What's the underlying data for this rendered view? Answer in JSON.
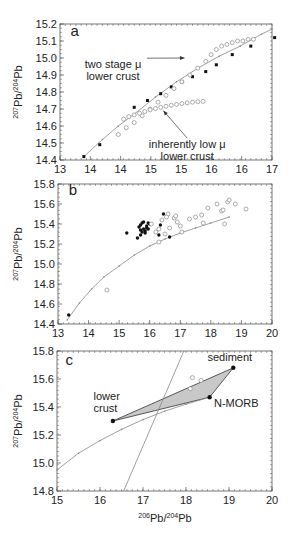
{
  "chart_data": [
    {
      "panel": "a",
      "type": "line",
      "title": "",
      "xlabel": "",
      "ylabel": "207Pb/204Pb",
      "xlim": [
        13,
        17
      ],
      "ylim": [
        14.4,
        15.2
      ],
      "xticks": [
        13,
        13.5,
        14,
        14.5,
        15,
        15.5,
        16,
        16.5,
        17
      ],
      "xtick_labels": [
        "13",
        "14",
        "14",
        "15",
        "15",
        "16",
        "16",
        "17"
      ],
      "yticks": [
        14.4,
        14.5,
        14.6,
        14.7,
        14.8,
        14.9,
        15.0,
        15.1,
        15.2
      ],
      "ytick_labels": [
        "14.4",
        "14.5",
        "14.6",
        "14.7",
        "14.8",
        "14.9",
        "15.0",
        "15.1",
        "15.2"
      ],
      "grid": false,
      "series": [
        {
          "name": "Pb growth curve (solid markers)",
          "marker": "filled-square",
          "x": [
            13.45,
            13.75,
            14.4,
            14.65,
            14.9,
            15.1,
            15.3,
            15.5,
            15.75,
            15.95,
            16.25,
            16.6,
            17.05
          ],
          "y": [
            14.42,
            14.49,
            14.71,
            14.75,
            14.79,
            14.83,
            14.86,
            14.89,
            14.92,
            14.96,
            15.02,
            15.07,
            15.12
          ]
        },
        {
          "name": "two stage μ lower crust",
          "marker": "open-circle",
          "x": [
            14.1,
            14.25,
            14.4,
            14.55,
            14.7,
            14.85,
            15.0,
            15.15,
            15.3,
            15.45,
            15.6,
            15.75,
            15.85,
            15.95,
            16.05,
            16.15,
            16.25,
            16.35,
            16.45,
            16.55,
            16.65
          ],
          "y": [
            14.55,
            14.59,
            14.62,
            14.66,
            14.7,
            14.74,
            14.78,
            14.82,
            14.86,
            14.9,
            14.94,
            14.98,
            15.02,
            15.05,
            15.07,
            15.08,
            15.09,
            15.1,
            15.1,
            15.11,
            15.11
          ]
        },
        {
          "name": "inherently low μ lower crust",
          "marker": "open-circle",
          "x": [
            14.2,
            14.3,
            14.4,
            14.5,
            14.6,
            14.7,
            14.8,
            14.9,
            15.0,
            15.1,
            15.2,
            15.3,
            15.4,
            15.5,
            15.6,
            15.7
          ],
          "y": [
            14.64,
            14.655,
            14.665,
            14.675,
            14.685,
            14.695,
            14.703,
            14.71,
            14.716,
            14.722,
            14.727,
            14.732,
            14.736,
            14.74,
            14.743,
            14.745
          ]
        },
        {
          "name": "model curve",
          "marker": "line",
          "x": [
            13.45,
            13.8,
            14.1,
            14.4,
            14.8,
            15.2,
            15.6,
            16.0,
            16.4,
            16.8,
            17.0
          ],
          "y": [
            14.42,
            14.52,
            14.6,
            14.67,
            14.77,
            14.86,
            14.94,
            15.01,
            15.07,
            15.14,
            15.17
          ]
        }
      ],
      "annotations": [
        {
          "label": "a",
          "x": 13.2,
          "y": 15.13
        },
        {
          "text_lines": [
            "two stage μ",
            "lower crust"
          ],
          "x": 14.0,
          "y": 14.94,
          "arrow_to": [
            15.35,
            15.0
          ]
        },
        {
          "text_lines": [
            "inherently low μ",
            "lower crust"
          ],
          "x": 15.4,
          "y": 14.47,
          "arrow_to": [
            14.95,
            14.69
          ]
        }
      ]
    },
    {
      "panel": "b",
      "type": "scatter",
      "xlabel": "",
      "ylabel": "207Pb/204Pb",
      "xlim": [
        13,
        20
      ],
      "ylim": [
        14.4,
        15.8
      ],
      "xticks": [
        13,
        14,
        15,
        16,
        17,
        18,
        19,
        20
      ],
      "xtick_labels": [
        "13",
        "14",
        "15",
        "16",
        "17",
        "18",
        "19",
        "20"
      ],
      "yticks": [
        14.4,
        14.6,
        14.8,
        15.0,
        15.2,
        15.4,
        15.6,
        15.8
      ],
      "ytick_labels": [
        "14.4",
        "14.6",
        "14.8",
        "15.0",
        "15.2",
        "15.4",
        "15.6",
        "15.8"
      ],
      "grid": false,
      "series": [
        {
          "name": "filled samples",
          "marker": "filled-circle",
          "x": [
            13.35,
            15.25,
            15.6,
            15.7,
            15.65,
            15.75,
            15.8,
            15.85,
            15.7,
            15.9,
            15.95,
            16.0,
            15.8,
            15.75,
            15.85,
            15.9,
            16.3,
            16.35,
            16.45,
            16.65,
            15.7,
            15.95
          ],
          "y": [
            14.49,
            15.31,
            15.26,
            15.29,
            15.37,
            15.41,
            15.35,
            15.33,
            15.39,
            15.36,
            15.35,
            15.4,
            15.42,
            15.32,
            15.31,
            15.38,
            15.29,
            15.39,
            15.5,
            15.27,
            15.34,
            15.41
          ]
        },
        {
          "name": "open samples",
          "marker": "open-circle",
          "x": [
            14.6,
            16.05,
            16.2,
            16.3,
            16.4,
            16.5,
            16.6,
            16.65,
            16.8,
            16.85,
            17.0,
            17.05,
            17.3,
            17.5,
            17.7,
            17.75,
            17.9,
            18.2,
            18.35,
            18.4,
            18.45,
            18.55,
            18.6,
            18.8,
            19.15,
            16.3,
            16.55,
            16.9
          ],
          "y": [
            14.74,
            15.4,
            15.32,
            15.22,
            15.44,
            15.3,
            15.5,
            15.36,
            15.46,
            15.48,
            15.38,
            15.32,
            15.45,
            15.47,
            15.49,
            15.41,
            15.56,
            15.6,
            15.53,
            15.54,
            15.4,
            15.62,
            15.64,
            15.6,
            15.55,
            15.35,
            15.47,
            15.42
          ]
        },
        {
          "name": "model curve",
          "marker": "line",
          "x": [
            13.3,
            13.7,
            14.1,
            14.5,
            15.0,
            15.5,
            16.0,
            16.5,
            17.0,
            17.5,
            18.0,
            18.6
          ],
          "y": [
            14.44,
            14.61,
            14.75,
            14.87,
            14.98,
            15.09,
            15.18,
            15.25,
            15.31,
            15.36,
            15.41,
            15.47
          ]
        }
      ],
      "annotations": [
        {
          "label": "b",
          "x": 13.35,
          "y": 15.69
        }
      ]
    },
    {
      "panel": "c",
      "type": "scatter",
      "xlabel": "206Pb/204Pb",
      "ylabel": "207Pb/204Pb",
      "xlim": [
        15,
        20
      ],
      "ylim": [
        14.8,
        15.8
      ],
      "xticks": [
        15,
        16,
        17,
        18,
        19,
        20
      ],
      "xtick_labels": [
        "15",
        "16",
        "17",
        "18",
        "19",
        "20"
      ],
      "yticks": [
        14.8,
        15.0,
        15.2,
        15.4,
        15.6,
        15.8
      ],
      "ytick_labels": [
        "14.8",
        "15.0",
        "15.2",
        "15.4",
        "15.6",
        "15.8"
      ],
      "grid": false,
      "series": [
        {
          "name": "end-members",
          "marker": "filled-circle",
          "points": [
            {
              "label": "lower crust",
              "x": 16.3,
              "y": 15.3
            },
            {
              "label": "N-MORB",
              "x": 18.55,
              "y": 15.47
            },
            {
              "label": "sediment",
              "x": 19.1,
              "y": 15.68
            }
          ]
        },
        {
          "name": "mixing triangle (shaded)",
          "marker": "polygon",
          "x": [
            16.3,
            19.1,
            18.55
          ],
          "y": [
            15.3,
            15.68,
            15.47
          ],
          "fill": "#c8c8c8"
        },
        {
          "name": "open samples",
          "marker": "open-circle",
          "x": [
            18.15,
            18.35,
            18.1
          ],
          "y": [
            15.61,
            15.59,
            15.53
          ]
        },
        {
          "name": "model curve",
          "marker": "line",
          "x": [
            15.0,
            15.5,
            16.0,
            16.5,
            17.0,
            17.5,
            18.0,
            18.55
          ],
          "y": [
            14.95,
            15.07,
            15.16,
            15.24,
            15.31,
            15.37,
            15.42,
            15.47
          ]
        },
        {
          "name": "steep reference line",
          "marker": "line",
          "x": [
            16.55,
            17.95
          ],
          "y": [
            14.8,
            15.8
          ]
        }
      ],
      "annotations": [
        {
          "label": "c",
          "x": 15.2,
          "y": 15.7
        },
        {
          "text_lines": [
            "lower",
            "crust"
          ],
          "x": 15.85,
          "y": 15.45
        },
        {
          "text_lines": [
            "N-MORB"
          ],
          "x": 18.65,
          "y": 15.4
        },
        {
          "text_lines": [
            "sediment"
          ],
          "x": 18.5,
          "y": 15.73
        }
      ]
    }
  ],
  "labels": {
    "ylabel_sup1": "207",
    "ylabel_mid": "Pb/",
    "ylabel_sup2": "204",
    "ylabel_end": "Pb",
    "xlabel_sup1": "206",
    "xlabel_mid": "Pb/",
    "xlabel_sup2": "204",
    "xlabel_end": "Pb"
  },
  "colors": {
    "axis": "#555555",
    "curve": "#888888",
    "filled": "#111111",
    "open": "#888888",
    "shade": "#c8c8c8"
  }
}
